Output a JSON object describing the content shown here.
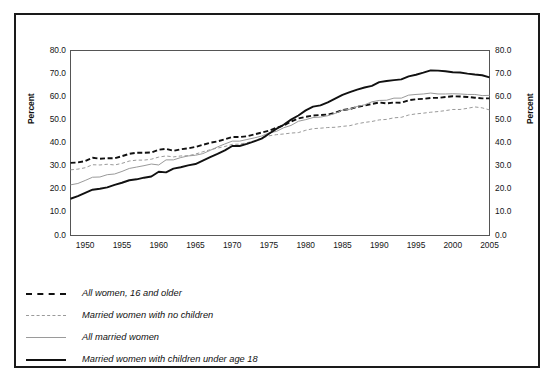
{
  "figure": {
    "background_color": "#ffffff",
    "border_color": "#1a1a1a"
  },
  "axis_titles": {
    "left": "Percent",
    "right": "Percent"
  },
  "legend": {
    "items": [
      {
        "label": "All women, 16 and older",
        "style": "thick-dash",
        "color": "#111111",
        "icon": "dashed-line-icon"
      },
      {
        "label": "Married women with no children",
        "style": "thin-dash",
        "color": "#9a9a9a",
        "icon": "dashed-line-icon"
      },
      {
        "label": "All married women",
        "style": "thin-solid",
        "color": "#9a9a9a",
        "icon": "solid-line-icon"
      },
      {
        "label": "Married women with children under age 18",
        "style": "thick-solid",
        "color": "#111111",
        "icon": "solid-line-icon"
      }
    ]
  },
  "chart_data": {
    "type": "line",
    "title": "",
    "subtitle": "",
    "xlabel": "",
    "ylabel": "Percent",
    "ylabel_right": "Percent",
    "xlim": [
      1948,
      2005
    ],
    "ylim": [
      0.0,
      80.0
    ],
    "ytick_step": 10.0,
    "grid": false,
    "legend_position": "below-plot-left",
    "ytick_labels": [
      "80.0",
      "70.0",
      "60.0",
      "50.0",
      "40.0",
      "30.0",
      "20.0",
      "10.0",
      "0.0"
    ],
    "ytick_values": [
      80.0,
      70.0,
      60.0,
      50.0,
      40.0,
      30.0,
      20.0,
      10.0,
      0.0
    ],
    "xtick_labels": [
      "1950",
      "1955",
      "1960",
      "1965",
      "1970",
      "1975",
      "1980",
      "1985",
      "1990",
      "1995",
      "2000",
      "2005"
    ],
    "xtick_values": [
      1950,
      1955,
      1960,
      1965,
      1970,
      1975,
      1980,
      1985,
      1990,
      1995,
      2000,
      2005
    ],
    "x": [
      1948,
      1949,
      1950,
      1951,
      1952,
      1953,
      1954,
      1955,
      1956,
      1957,
      1958,
      1959,
      1960,
      1961,
      1962,
      1963,
      1964,
      1965,
      1966,
      1967,
      1968,
      1969,
      1970,
      1971,
      1972,
      1973,
      1974,
      1975,
      1976,
      1977,
      1978,
      1979,
      1980,
      1981,
      1982,
      1983,
      1984,
      1985,
      1986,
      1987,
      1988,
      1989,
      1990,
      1991,
      1992,
      1993,
      1994,
      1995,
      1996,
      1997,
      1998,
      1999,
      2000,
      2001,
      2002,
      2003,
      2004,
      2005
    ],
    "series": [
      {
        "name": "All women, 16 and older",
        "style": "thick-dash",
        "color": "#111111",
        "values": [
          31.4,
          31.6,
          32.2,
          33.6,
          33.2,
          33.4,
          33.4,
          34.3,
          35.3,
          35.8,
          35.8,
          35.9,
          37.1,
          37.5,
          36.6,
          37.3,
          37.7,
          38.3,
          39.2,
          40.1,
          40.7,
          41.6,
          42.6,
          42.6,
          42.9,
          43.7,
          44.5,
          45.3,
          46.6,
          47.6,
          49.3,
          50.6,
          51.3,
          51.9,
          52.1,
          52.3,
          53.1,
          54.2,
          54.7,
          55.6,
          56.2,
          56.9,
          57.5,
          57.1,
          57.5,
          57.4,
          58.5,
          58.9,
          59.1,
          59.5,
          59.5,
          59.9,
          60.2,
          60.1,
          59.9,
          59.6,
          59.3,
          59.3
        ]
      },
      {
        "name": "Married women with no children",
        "style": "thin-dash",
        "color": "#9a9a9a",
        "values": [
          28.4,
          28.7,
          29.3,
          30.6,
          30.5,
          30.8,
          30.5,
          31.2,
          32.2,
          32.6,
          32.6,
          33.0,
          33.9,
          34.4,
          34.0,
          34.4,
          34.5,
          35.2,
          36.2,
          37.1,
          37.8,
          38.5,
          39.4,
          39.5,
          40.1,
          41.0,
          42.1,
          43.1,
          43.6,
          43.9,
          44.3,
          44.5,
          45.5,
          46.2,
          46.4,
          46.7,
          46.8,
          47.2,
          47.5,
          48.3,
          48.9,
          49.3,
          50.0,
          50.2,
          50.9,
          51.1,
          52.1,
          52.6,
          52.9,
          53.3,
          53.6,
          54.0,
          54.5,
          54.5,
          55.0,
          55.6,
          55.2,
          54.3
        ]
      },
      {
        "name": "All married women",
        "style": "thin-solid",
        "color": "#9a9a9a",
        "values": [
          21.9,
          22.5,
          23.8,
          25.2,
          25.3,
          26.3,
          26.6,
          27.7,
          29.0,
          29.6,
          30.2,
          30.9,
          30.5,
          32.7,
          32.7,
          33.7,
          34.4,
          34.7,
          35.4,
          36.8,
          38.3,
          39.6,
          40.8,
          40.8,
          41.5,
          42.2,
          43.0,
          44.4,
          45.0,
          46.6,
          47.6,
          49.4,
          50.1,
          51.0,
          51.2,
          51.8,
          52.8,
          54.2,
          54.6,
          55.8,
          56.5,
          57.8,
          58.4,
          58.5,
          59.4,
          59.4,
          60.7,
          61.0,
          61.2,
          61.6,
          61.2,
          61.2,
          61.3,
          61.2,
          61.0,
          61.0,
          60.5,
          60.6
        ]
      },
      {
        "name": "Married women with children under age 18",
        "style": "thick-solid",
        "color": "#111111",
        "values": [
          15.9,
          17.0,
          18.4,
          19.8,
          20.2,
          20.8,
          21.9,
          22.8,
          23.9,
          24.3,
          25.0,
          25.5,
          27.6,
          27.3,
          28.9,
          29.5,
          30.3,
          30.9,
          32.4,
          33.9,
          35.3,
          36.8,
          38.7,
          38.7,
          39.6,
          40.7,
          41.9,
          44.0,
          46.1,
          47.9,
          50.1,
          51.9,
          54.1,
          55.7,
          56.3,
          57.6,
          59.2,
          60.8,
          62.0,
          63.1,
          64.0,
          64.7,
          66.3,
          66.8,
          67.2,
          67.5,
          68.8,
          69.5,
          70.4,
          71.4,
          71.3,
          71.0,
          70.6,
          70.5,
          70.0,
          69.6,
          69.3,
          68.4
        ]
      }
    ]
  }
}
